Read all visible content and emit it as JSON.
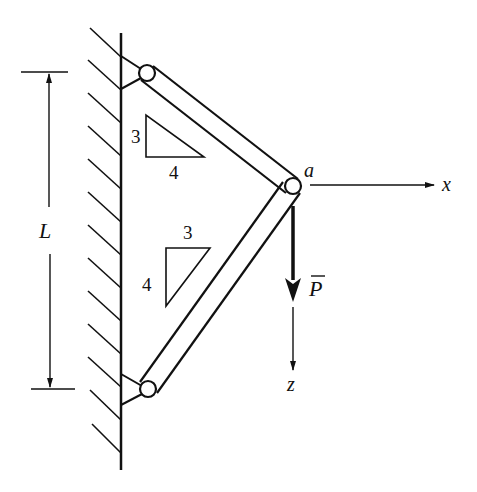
{
  "figure": {
    "colors": {
      "ink": "#111111",
      "background": "#ffffff"
    }
  },
  "labels": {
    "length": "L",
    "joint": "a",
    "x_axis": "x",
    "z_axis": "z",
    "load": "P",
    "upper_slope": {
      "vertical": "3",
      "horizontal": "4"
    },
    "lower_slope": {
      "horizontal": "3",
      "vertical": "4"
    }
  }
}
